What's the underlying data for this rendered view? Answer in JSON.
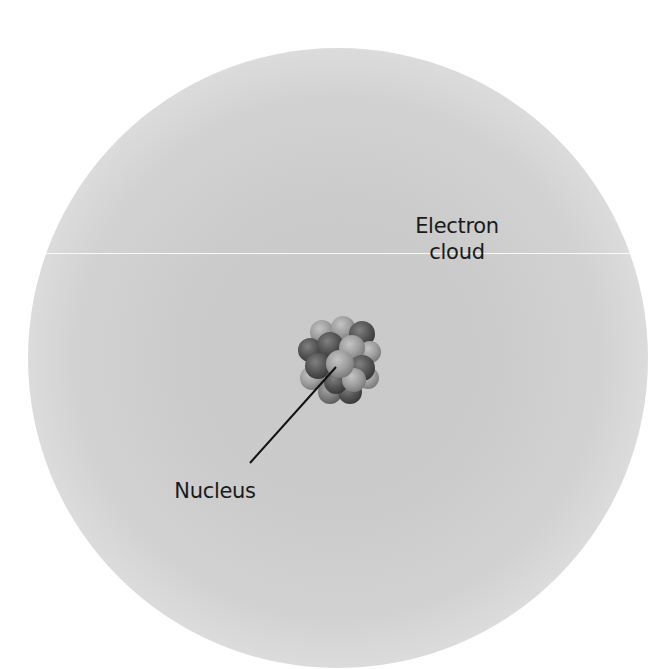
{
  "diagram": {
    "labels": {
      "electron_cloud_line1": "Electron",
      "electron_cloud_line2": "cloud",
      "nucleus": "Nucleus"
    },
    "parts": [
      {
        "name": "electron-cloud",
        "label": "Electron cloud"
      },
      {
        "name": "nucleus",
        "label": "Nucleus"
      }
    ],
    "colors": {
      "background": "#ffffff",
      "cloud_center": "#c9c9c9",
      "text": "#1a1a1a",
      "nucleon_light": "#a9a9a9",
      "nucleon_dark": "#5a5a5a",
      "leader_line": "#111111"
    }
  }
}
